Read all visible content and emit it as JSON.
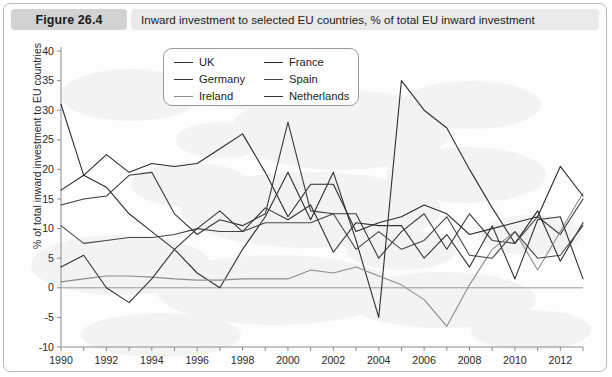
{
  "figure": {
    "label": "Figure 26.4",
    "caption": "Inward investment to selected EU countries, % of total EU inward investment"
  },
  "chart_data": {
    "type": "line",
    "title": "Inward investment to selected EU countries, % of total EU inward investment",
    "xlabel": "",
    "ylabel": "% of total inward investment to EU countries",
    "xlim": [
      1990,
      2013
    ],
    "ylim": [
      -10,
      40
    ],
    "yticks": [
      -10,
      -5,
      0,
      5,
      10,
      15,
      20,
      25,
      30,
      35,
      40
    ],
    "xticks": [
      1990,
      1992,
      1994,
      1996,
      1998,
      2000,
      2002,
      2004,
      2006,
      2008,
      2010,
      2012
    ],
    "xtick_labels": [
      "1990",
      "1992",
      "1994",
      "1996",
      "1998",
      "2000",
      "2002",
      "2004",
      "2006",
      "2008",
      "2010",
      "2012"
    ],
    "ytick_labels": [
      "-10",
      "-5",
      "0",
      "5",
      "10",
      "15",
      "20",
      "25",
      "30",
      "35",
      "40"
    ],
    "grid": false,
    "legend_position": "upper-center",
    "x": [
      1990,
      1991,
      1992,
      1993,
      1994,
      1995,
      1996,
      1997,
      1998,
      1999,
      2000,
      2001,
      2002,
      2003,
      2004,
      2005,
      2006,
      2007,
      2008,
      2009,
      2010,
      2011,
      2012,
      2013
    ],
    "series": [
      {
        "name": "UK",
        "color": "#2f2f2f",
        "values": [
          31.0,
          19.0,
          17.0,
          12.5,
          9.5,
          6.5,
          2.5,
          0.0,
          6.5,
          12.0,
          19.5,
          11.5,
          19.5,
          8.0,
          -5.0,
          35.0,
          30.0,
          27.0,
          20.0,
          13.5,
          7.5,
          13.0,
          4.5,
          11.0
        ]
      },
      {
        "name": "Germany",
        "color": "#3a3a3a",
        "values": [
          14.0,
          15.0,
          15.5,
          19.0,
          19.5,
          12.5,
          9.0,
          11.5,
          10.5,
          12.5,
          28.0,
          13.0,
          12.5,
          12.5,
          5.0,
          9.5,
          12.5,
          6.5,
          12.5,
          8.0,
          7.5,
          12.0,
          9.0,
          15.0
        ]
      },
      {
        "name": "Ireland",
        "color": "#8c8c8c",
        "values": [
          1.0,
          1.5,
          2.0,
          2.0,
          1.8,
          1.5,
          1.3,
          1.3,
          1.5,
          1.5,
          1.5,
          3.0,
          2.5,
          3.5,
          2.0,
          0.5,
          -2.0,
          -6.5,
          0.5,
          6.5,
          9.5,
          3.0,
          9.5,
          16.0
        ]
      },
      {
        "name": "France",
        "color": "#2b2b2b",
        "values": [
          16.5,
          19.0,
          22.5,
          19.5,
          21.0,
          20.5,
          21.0,
          23.5,
          26.0,
          19.5,
          12.0,
          17.5,
          17.5,
          9.5,
          11.0,
          12.0,
          14.0,
          12.5,
          9.0,
          10.0,
          11.0,
          12.0,
          20.5,
          15.5
        ]
      },
      {
        "name": "Spain",
        "color": "#454545",
        "values": [
          10.5,
          7.5,
          8.0,
          8.5,
          8.5,
          9.0,
          10.0,
          9.5,
          9.5,
          11.0,
          11.0,
          11.0,
          12.5,
          6.5,
          9.5,
          6.5,
          8.0,
          12.0,
          5.5,
          5.0,
          9.5,
          5.0,
          5.5,
          10.5
        ]
      },
      {
        "name": "Netherlands",
        "color": "#333333",
        "values": [
          3.5,
          5.5,
          0.0,
          -2.5,
          1.5,
          6.5,
          10.0,
          13.0,
          9.5,
          13.5,
          11.5,
          14.0,
          6.0,
          11.0,
          10.5,
          10.5,
          5.0,
          9.0,
          3.5,
          10.5,
          1.5,
          11.5,
          12.0,
          1.5
        ]
      }
    ]
  }
}
